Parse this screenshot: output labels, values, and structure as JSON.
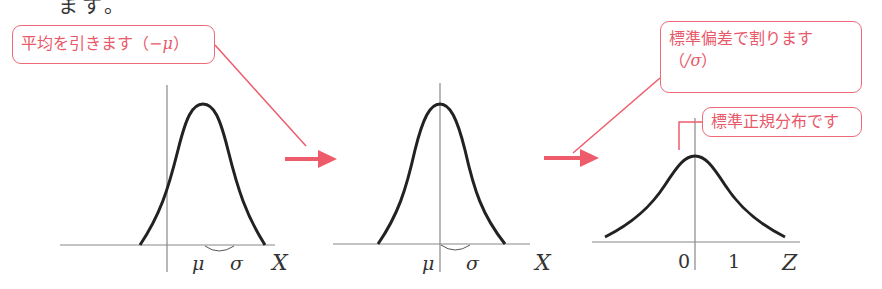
{
  "header": {
    "fragment_text": "ます。"
  },
  "callouts": {
    "subtract_mean": {
      "text": "平均を引きます（",
      "math": "−μ",
      "close": "）"
    },
    "divide_sd": {
      "line1": "標準偏差で割ります",
      "open": "（",
      "math": "/σ",
      "close": "）"
    },
    "standard_normal": {
      "text": "標準正規分布です"
    }
  },
  "panels": [
    {
      "name": "original",
      "labels": {
        "mean": "μ",
        "sd": "σ",
        "axis": "X"
      }
    },
    {
      "name": "centered",
      "labels": {
        "mean": "μ",
        "sd": "σ",
        "axis": "X"
      }
    },
    {
      "name": "standardized",
      "labels": {
        "zero": "0",
        "one": "1",
        "axis": "Z"
      }
    }
  ],
  "colors": {
    "accent": "#ee5c6c",
    "curve": "#222222",
    "axis": "#777777"
  }
}
